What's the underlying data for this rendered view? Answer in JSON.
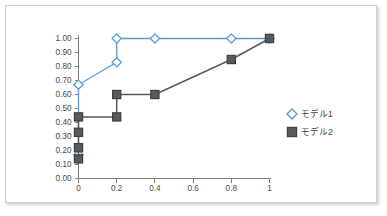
{
  "chart_data": {
    "type": "line",
    "title": "",
    "xlabel": "",
    "ylabel": "",
    "xlim": [
      0,
      1
    ],
    "ylim": [
      0,
      1
    ],
    "grid": false,
    "legend_position": "right",
    "x_ticks": [
      "0",
      "0.2",
      "0.4",
      "0.6",
      "0.8",
      "1"
    ],
    "x_tick_values": [
      0,
      0.2,
      0.4,
      0.6,
      0.8,
      1
    ],
    "y_ticks": [
      "0.00",
      "0.10",
      "0.20",
      "0.30",
      "0.40",
      "0.50",
      "0.60",
      "0.70",
      "0.80",
      "0.90",
      "1.00"
    ],
    "y_tick_values": [
      0,
      0.1,
      0.2,
      0.3,
      0.4,
      0.5,
      0.6,
      0.7,
      0.8,
      0.9,
      1.0
    ],
    "series": [
      {
        "name": "モデル1",
        "color": "#5b9bd5",
        "marker": "diamond",
        "points": [
          {
            "x": 0,
            "y": 0.17
          },
          {
            "x": 0,
            "y": 0.67
          },
          {
            "x": 0.2,
            "y": 0.83
          },
          {
            "x": 0.2,
            "y": 1.0
          },
          {
            "x": 0.4,
            "y": 1.0
          },
          {
            "x": 0.8,
            "y": 1.0
          },
          {
            "x": 1,
            "y": 1.0
          }
        ]
      },
      {
        "name": "モデル2",
        "color": "#595959",
        "marker": "square",
        "points": [
          {
            "x": 0,
            "y": 0.14
          },
          {
            "x": 0,
            "y": 0.22
          },
          {
            "x": 0,
            "y": 0.33
          },
          {
            "x": 0,
            "y": 0.44
          },
          {
            "x": 0.2,
            "y": 0.44
          },
          {
            "x": 0.2,
            "y": 0.6
          },
          {
            "x": 0.4,
            "y": 0.6
          },
          {
            "x": 0.8,
            "y": 0.85
          },
          {
            "x": 1,
            "y": 1.0
          }
        ]
      }
    ],
    "legend": [
      {
        "label": "モデル1",
        "color": "#5b9bd5",
        "marker": "diamond"
      },
      {
        "label": "モデル2",
        "color": "#595959",
        "marker": "square"
      }
    ]
  },
  "colors": {
    "series1": "#5b9bd5",
    "series1_fill": "#ffffff",
    "series2": "#595959",
    "series2_edge": "#3f3f3f",
    "axis": "#7f7f7f",
    "tick_text": "#4a4a4a",
    "card_border": "#d0d0d0",
    "background": "#ffffff"
  }
}
